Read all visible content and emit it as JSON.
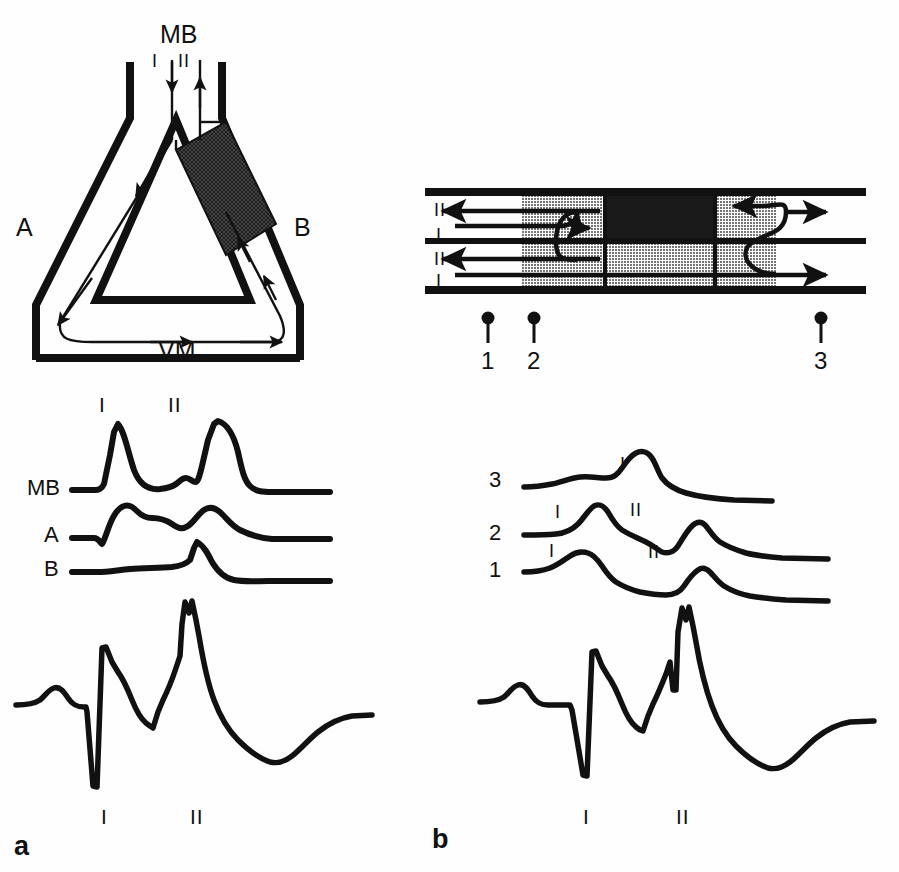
{
  "figure": {
    "panels": [
      {
        "id": "a",
        "label": "a"
      },
      {
        "id": "b",
        "label": "b"
      }
    ]
  },
  "panel_a": {
    "schematic": {
      "name": "triangular-reentry-circuit",
      "labels": {
        "top": "MB",
        "left": "A",
        "right": "B",
        "bottom": "VM",
        "beat_one": "I",
        "beat_two": "II"
      }
    },
    "traces": {
      "name": "pressure-traces-panel-a",
      "rows": [
        {
          "label": "MB"
        },
        {
          "label": "A"
        },
        {
          "label": "B"
        }
      ],
      "markers": [
        {
          "label": "I"
        },
        {
          "label": "II"
        }
      ]
    },
    "ecg": {
      "name": "ecg-trace-panel-a",
      "markers": [
        {
          "label": "I"
        },
        {
          "label": "II"
        }
      ]
    }
  },
  "panel_b": {
    "schematic": {
      "name": "linear-conduction-bundle",
      "left_labels": [
        "II",
        "I",
        "II",
        "I"
      ],
      "site_markers": [
        {
          "label": "1"
        },
        {
          "label": "2"
        },
        {
          "label": "3"
        }
      ]
    },
    "traces": {
      "name": "pressure-traces-panel-b",
      "rows": [
        {
          "label": "3",
          "markers": [
            "I"
          ]
        },
        {
          "label": "2",
          "markers": [
            "I",
            "II"
          ]
        },
        {
          "label": "1",
          "markers": [
            "I",
            "II"
          ]
        }
      ]
    },
    "ecg": {
      "name": "ecg-trace-panel-b",
      "markers": [
        {
          "label": "I"
        },
        {
          "label": "II"
        }
      ]
    }
  },
  "colors": {
    "ink": "#111111",
    "background": "#fefefe",
    "shade_light": "#9a9a9a",
    "shade_dark": "#1a1a1a"
  }
}
